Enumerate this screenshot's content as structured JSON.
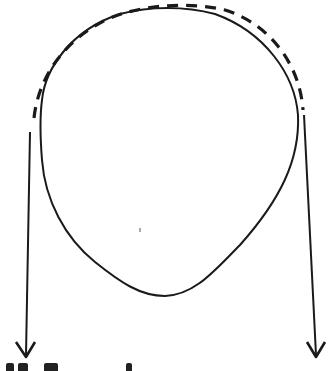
{
  "diagram": {
    "colors": {
      "stroke": "#1a1a1a",
      "background": "#ffffff"
    },
    "elements": [
      {
        "id": "body",
        "type": "closed-curve",
        "style": "solid"
      },
      {
        "id": "contact-arc",
        "type": "arc",
        "style": "dashed"
      },
      {
        "id": "left-strand",
        "type": "arrow",
        "direction": "down"
      },
      {
        "id": "right-strand",
        "type": "arrow",
        "direction": "down"
      }
    ],
    "footer_text_note": "bottom text cut off (not legible)"
  }
}
